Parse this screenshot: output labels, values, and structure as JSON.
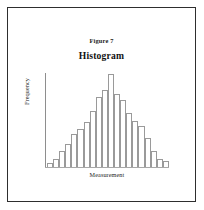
{
  "figure": {
    "caption": "Figure 7",
    "border_color": "#2e2e2e"
  },
  "chart_data": {
    "type": "bar",
    "title": "Histogram",
    "subtitle": "Figure 7",
    "xlabel": "Measurement",
    "ylabel": "Frequency",
    "grid": false,
    "legend": null,
    "axis_color": "#8e8e8e",
    "bar_fill": "#ffffff",
    "bar_stroke": "#9a9a9a",
    "ylim": [
      0,
      100
    ],
    "categories": [
      "1",
      "2",
      "3",
      "4",
      "5",
      "6",
      "7",
      "8",
      "9",
      "10",
      "11",
      "12",
      "13",
      "14",
      "15",
      "16",
      "17",
      "18",
      "19",
      "20"
    ],
    "values": [
      4,
      9,
      17,
      25,
      36,
      41,
      48,
      60,
      75,
      83,
      100,
      79,
      72,
      58,
      50,
      44,
      31,
      17,
      9,
      6
    ]
  }
}
